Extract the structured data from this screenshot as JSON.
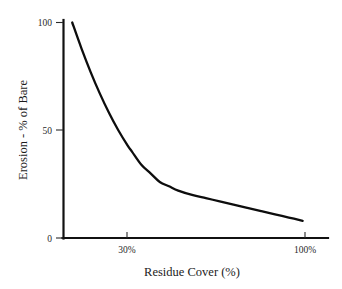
{
  "chart_data": {
    "type": "line",
    "title": "",
    "xlabel": "Residue Cover (%)",
    "ylabel": "Erosion - % of Bare",
    "xlim": [
      0,
      115
    ],
    "ylim": [
      0,
      100
    ],
    "grid": false,
    "legend": null,
    "x_ticks": [
      {
        "value": 30,
        "label": "30%"
      },
      {
        "value": 100,
        "label": "100%"
      }
    ],
    "y_ticks": [
      {
        "value": 0,
        "label": "0"
      },
      {
        "value": 50,
        "label": "50"
      },
      {
        "value": 100,
        "label": "100"
      }
    ],
    "series": [
      {
        "name": "Erosion",
        "color": "#0d0d0d",
        "x": [
          4,
          8,
          12,
          16,
          20,
          24,
          28,
          30,
          34,
          38,
          42,
          46,
          50,
          56,
          62,
          68,
          74,
          80,
          86,
          92,
          98,
          104
        ],
        "y": [
          100,
          88,
          77,
          67,
          58,
          50,
          43,
          40,
          34,
          30,
          26,
          24,
          22,
          20,
          18.5,
          17,
          15.5,
          14,
          12.5,
          11,
          9.5,
          8
        ]
      }
    ]
  },
  "axis": {
    "y_top_label": "100",
    "y_mid_label": "50",
    "y_zero_label": "0",
    "x_first_label": "30%",
    "x_second_label": "100%",
    "x_title": "Residue Cover (%)",
    "y_title": "Erosion - % of Bare"
  }
}
